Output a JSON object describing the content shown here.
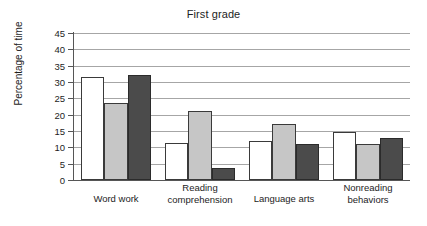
{
  "chart_data": {
    "type": "bar",
    "title": "First grade",
    "xlabel": "",
    "ylabel": "Percentage of time",
    "categories": [
      "Word work",
      "Reading\ncomprehension",
      "Language arts",
      "Nonreading\nbehaviors"
    ],
    "series": [
      {
        "name": "series-1",
        "color": "#ffffff",
        "values": [
          31.5,
          11.2,
          12.0,
          14.8
        ]
      },
      {
        "name": "series-2",
        "color": "#c6c6c6",
        "values": [
          23.5,
          21.0,
          17.0,
          11.0
        ]
      },
      {
        "name": "series-3",
        "color": "#4b4b4b",
        "values": [
          32.1,
          3.8,
          11.0,
          13.0
        ]
      }
    ],
    "ylim": [
      0,
      45
    ],
    "yticks": [
      0,
      5,
      10,
      15,
      20,
      25,
      30,
      35,
      40,
      45
    ],
    "ytick_labels": [
      "0",
      "5",
      "10",
      "15",
      "20",
      "25",
      "30",
      "35",
      "40",
      "45"
    ],
    "grid": true,
    "legend": "none"
  },
  "colors": {
    "axis": "#565656",
    "gridline": "#a6a6a6",
    "bar_outline": "#3a3a3a",
    "text": "#1d1d1d",
    "background": "#ffffff"
  }
}
